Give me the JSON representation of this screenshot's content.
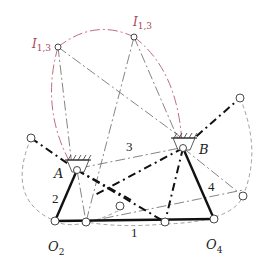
{
  "diagram": {
    "labels": {
      "i13_left": "I",
      "i13_left_sub": "1,3",
      "i13_right": "I",
      "i13_right_sub": "1,3",
      "A": "A",
      "B": "B",
      "O2": "O",
      "O2_sub": "2",
      "O4": "O",
      "O4_sub": "4",
      "link1": "1",
      "link2": "2",
      "link3": "3",
      "link4": "4"
    },
    "colors": {
      "link": "#111111",
      "construction": "#666666",
      "arc_red": "#b85c6c",
      "dashed_circle": "#888888"
    },
    "points": {
      "I13_left": [
        58,
        47
      ],
      "I13_right": [
        134,
        37
      ],
      "A": [
        77,
        170
      ],
      "B": [
        183,
        148
      ],
      "O2": [
        55,
        221
      ],
      "O4": [
        214,
        219
      ],
      "P_left": [
        31,
        138
      ],
      "P_right_top": [
        240,
        98
      ],
      "P_right_low": [
        243,
        196
      ],
      "P_mid": [
        120,
        207
      ],
      "P_bot1": [
        86,
        222
      ],
      "P_bot2": [
        165,
        222
      ]
    }
  }
}
